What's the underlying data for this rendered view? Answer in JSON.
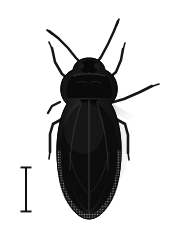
{
  "figure": {
    "type": "specimen-photograph",
    "view": "dorsal",
    "background_color": "#ffffff",
    "width_px": 170,
    "height_px": 236,
    "body_color": "#0d0d0d",
    "body_highlight_color": "#3a3a3a",
    "speckle_color": "#b9b9b9",
    "shadow_color": "#c9c9c9",
    "alt_text": "Dorsal view photograph of a dark-bodied true bug with long antennae and legs, shown against a white background with a scale bar at lower left"
  },
  "scale_bar": {
    "name": "scale-bar",
    "orientation": "vertical",
    "style": "I-beam",
    "color": "#101010",
    "label": "",
    "x_center_px": 26,
    "y_top_px": 167,
    "y_bottom_px": 212,
    "length_px": 45,
    "cap_width_px": 11,
    "stem_width_px": 2
  },
  "specimen": {
    "name": "insect-specimen",
    "parts": [
      {
        "name": "head",
        "cx": 89,
        "cy": 68,
        "w": 17,
        "h": 13
      },
      {
        "name": "pronotum",
        "cx": 89,
        "cy": 82,
        "w": 37,
        "h": 18
      },
      {
        "name": "scutellum",
        "cx": 89,
        "cy": 95,
        "w": 17,
        "h": 14
      },
      {
        "name": "left-hemelytron",
        "cx": 76,
        "cy": 135,
        "w": 33,
        "h": 100
      },
      {
        "name": "right-hemelytron",
        "cx": 102,
        "cy": 135,
        "w": 33,
        "h": 100
      },
      {
        "name": "abdomen-tip",
        "cx": 89,
        "cy": 210,
        "w": 40,
        "h": 22
      }
    ],
    "antennae": [
      {
        "name": "left-antenna",
        "base_x": 82,
        "base_y": 63,
        "tip_x": 48,
        "tip_y": 30
      },
      {
        "name": "right-antenna",
        "base_x": 96,
        "base_y": 63,
        "tip_x": 118,
        "tip_y": 20
      }
    ],
    "legs": [
      {
        "name": "left-foreleg",
        "side": "left",
        "position": "fore"
      },
      {
        "name": "right-foreleg",
        "side": "right",
        "position": "fore"
      },
      {
        "name": "left-midleg",
        "side": "left",
        "position": "mid"
      },
      {
        "name": "right-midleg",
        "side": "right",
        "position": "mid"
      },
      {
        "name": "left-hindleg",
        "side": "left",
        "position": "hind"
      },
      {
        "name": "right-hindleg",
        "side": "right",
        "position": "hind"
      }
    ]
  },
  "geometry": {
    "body_outline": "M 89,58 C 80,58 74,63 73,70 C 68,72 62,77 61,86 C 60,94 63,100 67,104 C 62,112 58,126 57,144 C 56,166 60,188 68,202 C 75,214 82,219 89,219 C 96,219 103,214 110,202 C 118,188 122,166 121,144 C 120,126 116,112 111,104 C 115,100 118,94 117,86 C 116,77 110,72 105,70 C 104,63 98,58 89,58 Z",
    "wing_seam": "M 89,100 L 89,218",
    "claval_left": "M 80,104 C 74,122 70,146 70,170",
    "claval_right": "M 98,104 C 104,122 108,146 108,170",
    "cuneus_left": "M 70,150 C 74,168 80,182 88,190",
    "cuneus_right": "M 108,150 C 104,168 98,182 90,190",
    "pronotum_collar": "M 72,75 C 80,72 98,72 106,75",
    "margin_left": "M 58,150 C 59,178 66,200 76,211",
    "margin_right": "M 120,150 C 119,178 112,200 102,211"
  }
}
